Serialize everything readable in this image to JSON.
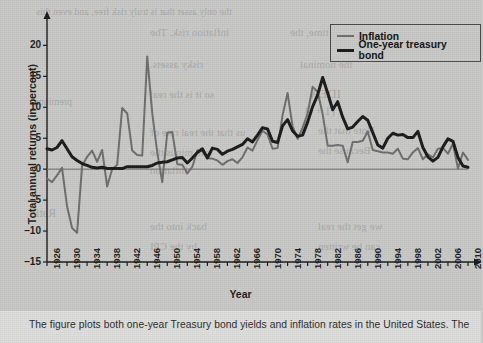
{
  "figure": {
    "axis_title_y": "Total annual returns (in percent)",
    "axis_title_x": "Year",
    "caption": "The figure plots both one-year Treasury bond yields and inflation rates in the United States. The"
  },
  "legend": {
    "position": "top-right",
    "items": [
      {
        "label": "Inflation",
        "color": "#6e6e6e",
        "width": 2
      },
      {
        "label": "One-year treasury bond",
        "color": "#1a1a1a",
        "width": 3
      }
    ]
  },
  "ghost_text": [
    {
      "text": "the only asset that is truly risk free, and even this",
      "x": 36,
      "y": 6,
      "size": 10
    },
    {
      "text": "inflation risk. The",
      "x": 150,
      "y": 26,
      "size": 11
    },
    {
      "text": "same time, the",
      "x": 290,
      "y": 26,
      "size": 11
    },
    {
      "text": "risky assets.",
      "x": 150,
      "y": 58,
      "size": 11
    },
    {
      "text": "the nominal",
      "x": 300,
      "y": 58,
      "size": 11
    },
    {
      "text": "so it is the real",
      "x": 150,
      "y": 88,
      "size": 11
    },
    {
      "text": "IDEA",
      "x": 310,
      "y": 86,
      "size": 13
    },
    {
      "text": "premium",
      "x": 36,
      "y": 96,
      "size": 10
    },
    {
      "text": "r  (1 + i)",
      "x": 305,
      "y": 104,
      "size": 12
    },
    {
      "text": "us that the real rate of",
      "x": 150,
      "y": 126,
      "size": 11
    },
    {
      "text": "Note that the",
      "x": 318,
      "y": 124,
      "size": 11
    },
    {
      "text": "rate minus the",
      "x": 150,
      "y": 146,
      "size": 11
    },
    {
      "text": "Because the",
      "x": 318,
      "y": 144,
      "size": 11
    },
    {
      "text": "inflation",
      "x": 150,
      "y": 164,
      "size": 11
    },
    {
      "text": "Ratio",
      "x": 30,
      "y": 206,
      "size": 12
    },
    {
      "text": "back into the",
      "x": 150,
      "y": 220,
      "size": 11
    },
    {
      "text": "we get the real",
      "x": 318,
      "y": 220,
      "size": 11
    },
    {
      "text": "by the CPI",
      "x": 150,
      "y": 240,
      "size": 11
    },
    {
      "text": "can be written",
      "x": 318,
      "y": 240,
      "size": 11
    }
  ],
  "chart_data": {
    "type": "line",
    "title": "",
    "xlabel": "Year",
    "ylabel": "Total annual returns (in percent)",
    "xlim": [
      1926,
      2010
    ],
    "ylim": [
      -15,
      22
    ],
    "yticks": [
      -15,
      -10,
      -5,
      0,
      5,
      10,
      15,
      20
    ],
    "xticks": [
      1926,
      1930,
      1934,
      1938,
      1942,
      1946,
      1950,
      1954,
      1958,
      1962,
      1966,
      1970,
      1974,
      1978,
      1982,
      1986,
      1990,
      1994,
      1998,
      2002,
      2006,
      2010
    ],
    "grid": false,
    "zero_line": true,
    "x": [
      1926,
      1927,
      1928,
      1929,
      1930,
      1931,
      1932,
      1933,
      1934,
      1935,
      1936,
      1937,
      1938,
      1939,
      1940,
      1941,
      1942,
      1943,
      1944,
      1945,
      1946,
      1947,
      1948,
      1949,
      1950,
      1951,
      1952,
      1953,
      1954,
      1955,
      1956,
      1957,
      1958,
      1959,
      1960,
      1961,
      1962,
      1963,
      1964,
      1965,
      1966,
      1967,
      1968,
      1969,
      1970,
      1971,
      1972,
      1973,
      1974,
      1975,
      1976,
      1977,
      1978,
      1979,
      1980,
      1981,
      1982,
      1983,
      1984,
      1985,
      1986,
      1987,
      1988,
      1989,
      1990,
      1991,
      1992,
      1993,
      1994,
      1995,
      1996,
      1997,
      1998,
      1999,
      2000,
      2001,
      2002,
      2003,
      2004,
      2005,
      2006,
      2007,
      2008,
      2009,
      2010
    ],
    "series": [
      {
        "name": "Inflation",
        "color": "#6e6e6e",
        "width": 2,
        "values": [
          -1.5,
          -2.1,
          -1.0,
          0.2,
          -6.0,
          -9.5,
          -10.3,
          0.5,
          2.0,
          3.0,
          1.2,
          3.1,
          -2.8,
          0.0,
          0.7,
          9.9,
          9.0,
          3.0,
          2.3,
          2.2,
          18.2,
          9.0,
          2.7,
          -2.1,
          5.9,
          6.0,
          0.8,
          0.7,
          -0.7,
          0.4,
          3.0,
          2.9,
          1.8,
          1.7,
          1.4,
          0.7,
          1.3,
          1.6,
          1.0,
          1.9,
          3.5,
          3.0,
          4.7,
          6.2,
          5.6,
          3.3,
          3.4,
          8.7,
          12.3,
          6.9,
          4.9,
          6.7,
          9.0,
          13.3,
          12.5,
          8.9,
          3.8,
          3.8,
          3.9,
          3.8,
          1.1,
          4.4,
          4.4,
          4.6,
          6.1,
          3.1,
          2.9,
          2.7,
          2.7,
          2.5,
          3.3,
          1.7,
          1.6,
          2.7,
          3.4,
          1.6,
          2.4,
          1.9,
          3.3,
          3.4,
          2.5,
          4.1,
          0.1,
          2.7,
          1.5
        ]
      },
      {
        "name": "One-year treasury bond",
        "color": "#1a1a1a",
        "width": 3,
        "values": [
          3.3,
          3.1,
          3.5,
          4.6,
          3.3,
          2.0,
          1.4,
          0.9,
          0.6,
          0.3,
          0.2,
          0.3,
          0.1,
          0.1,
          0.1,
          0.1,
          0.4,
          0.4,
          0.4,
          0.4,
          0.4,
          0.6,
          1.0,
          1.1,
          1.2,
          1.5,
          1.8,
          1.9,
          1.0,
          1.8,
          2.7,
          3.3,
          1.8,
          3.4,
          3.2,
          2.4,
          2.9,
          3.2,
          3.6,
          4.0,
          4.9,
          4.4,
          5.5,
          6.7,
          6.5,
          4.5,
          4.3,
          7.0,
          8.0,
          6.2,
          5.3,
          5.5,
          7.6,
          10.1,
          12.0,
          14.8,
          12.3,
          9.6,
          10.9,
          8.4,
          6.5,
          6.8,
          7.7,
          8.5,
          7.9,
          5.9,
          3.9,
          3.4,
          5.0,
          5.8,
          5.5,
          5.6,
          5.1,
          5.1,
          6.1,
          3.5,
          2.0,
          1.3,
          1.9,
          3.6,
          4.9,
          4.5,
          1.9,
          0.5,
          0.3
        ]
      }
    ]
  }
}
